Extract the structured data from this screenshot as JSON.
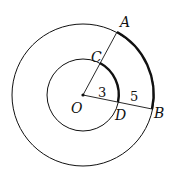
{
  "diagram": {
    "type": "concentric-circles-with-arcs",
    "center_label": "O",
    "points": [
      {
        "id": "A",
        "label": "A"
      },
      {
        "id": "B",
        "label": "B"
      },
      {
        "id": "C",
        "label": "C"
      },
      {
        "id": "D",
        "label": "D"
      }
    ],
    "segment_labels": {
      "OD": "3",
      "DB": "5"
    },
    "colors": {
      "stroke": "#111111",
      "background": "#ffffff"
    }
  }
}
